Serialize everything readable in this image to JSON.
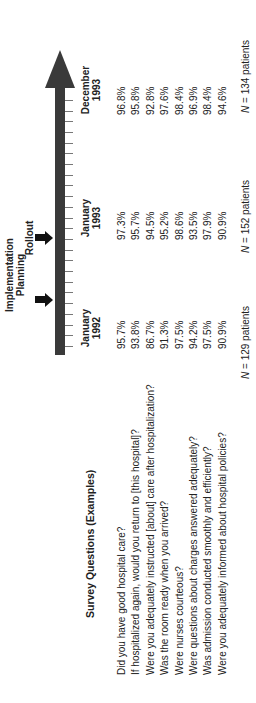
{
  "title": "Survey Questions (Examples)",
  "timeline": {
    "milestones": [
      {
        "label": "Implementation Planning"
      },
      {
        "label": "Rollout"
      }
    ],
    "tick_count": 24
  },
  "columns": [
    {
      "month": "January",
      "year": "1992",
      "n_label": "N",
      "n_text": " = 129 patients"
    },
    {
      "month": "January",
      "year": "1993",
      "n_label": "N",
      "n_text": " = 152 patients"
    },
    {
      "month": "December",
      "year": "1993",
      "n_label": "N",
      "n_text": " = 134 patients"
    }
  ],
  "rows": [
    {
      "question": "Did you have good hospital care?",
      "values": [
        "95.7%",
        "97.3%",
        "96.8%"
      ]
    },
    {
      "question": "If hospitalized again, would you return to [this hospital]?",
      "values": [
        "93.8%",
        "95.7%",
        "95.8%"
      ]
    },
    {
      "question": "Were you adequately instructed [about] care after hospitalization?",
      "values": [
        "86.7%",
        "94.5%",
        "92.8%"
      ]
    },
    {
      "question": "Was the room ready when you arrived?",
      "values": [
        "91.3%",
        "95.2%",
        "97.6%"
      ]
    },
    {
      "question": "Were nurses courteous?",
      "values": [
        "97.5%",
        "98.6%",
        "98.4%"
      ]
    },
    {
      "question": "Were questions about charges answered adequately?",
      "values": [
        "94.2%",
        "93.5%",
        "96.9%"
      ]
    },
    {
      "question": "Was admission conducted smoothly and efficiently?",
      "values": [
        "97.5%",
        "97.9%",
        "98.4%"
      ]
    },
    {
      "question": "Were you adequately informed about hospital policies?",
      "values": [
        "90.9%",
        "90.9%",
        "94.6%"
      ]
    }
  ]
}
